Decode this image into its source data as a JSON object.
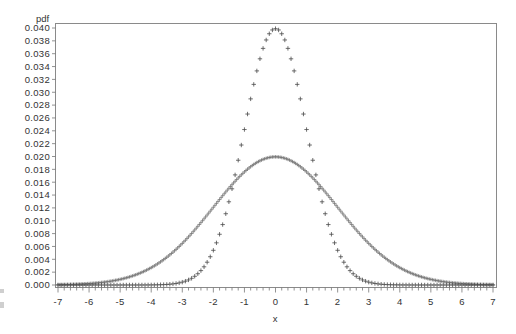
{
  "chart_data": {
    "type": "scatter",
    "title": "",
    "xlabel": "x",
    "ylabel": "pdf",
    "xlim": [
      -7,
      7
    ],
    "ylim": [
      0.0,
      0.04
    ],
    "grid": false,
    "legend": null,
    "x_ticks": [
      "-7",
      "-6",
      "-5",
      "-4",
      "-3",
      "-2",
      "-1",
      "0",
      "1",
      "2",
      "3",
      "4",
      "5",
      "6",
      "7"
    ],
    "x_minor_step": 0.2,
    "y_ticks": [
      "0.000",
      "0.002",
      "0.004",
      "0.006",
      "0.008",
      "0.010",
      "0.012",
      "0.014",
      "0.016",
      "0.018",
      "0.020",
      "0.022",
      "0.024",
      "0.026",
      "0.028",
      "0.030",
      "0.032",
      "0.034",
      "0.036",
      "0.038",
      "0.040"
    ],
    "marker": "+",
    "series": [
      {
        "name": "narrow (sd=1, peak 0.040)",
        "mean": 0,
        "sd": 1,
        "scale": 0.1,
        "x_step": 0.1,
        "peak": 0.0399,
        "sample_points": [
          {
            "x": -3,
            "y": 0.0004
          },
          {
            "x": -2,
            "y": 0.0054
          },
          {
            "x": -1,
            "y": 0.0242
          },
          {
            "x": 0,
            "y": 0.0399
          },
          {
            "x": 1,
            "y": 0.0242
          },
          {
            "x": 2,
            "y": 0.0054
          },
          {
            "x": 3,
            "y": 0.0004
          }
        ]
      },
      {
        "name": "wide (sd=2, peak 0.020)",
        "mean": 0,
        "sd": 2,
        "scale": 0.1,
        "x_step": 0.05,
        "peak": 0.0199,
        "sample_points": [
          {
            "x": -6,
            "y": 0.0002
          },
          {
            "x": -4,
            "y": 0.0027
          },
          {
            "x": -2,
            "y": 0.0121
          },
          {
            "x": 0,
            "y": 0.0199
          },
          {
            "x": 2,
            "y": 0.0121
          },
          {
            "x": 4,
            "y": 0.0027
          },
          {
            "x": 6,
            "y": 0.0002
          }
        ]
      }
    ]
  },
  "layout": {
    "frame": {
      "left": 55,
      "top": 23,
      "right": 496,
      "bottom": 287
    },
    "x_px": {
      "min": 58,
      "max": 493
    },
    "y_px": {
      "zero": 285,
      "max": 28
    }
  }
}
